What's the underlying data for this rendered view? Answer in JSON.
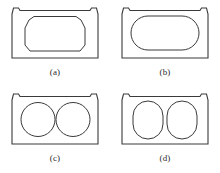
{
  "figure": {
    "type": "engineering-line-drawing",
    "stroke_color": "#3a3a3a",
    "fill_color": "#ffffff",
    "background_color": "#ffffff",
    "panels": [
      {
        "label": "(a)",
        "outer_shape": "trapezoidal box with notched top corners",
        "inner_void": "single octagonal cell",
        "void_count": 1
      },
      {
        "label": "(b)",
        "outer_shape": "trapezoidal box with notched top corners",
        "inner_void": "single horizontal stadium cell",
        "void_count": 1
      },
      {
        "label": "(c)",
        "outer_shape": "trapezoidal box with notched top corners",
        "inner_void": "two circular cells",
        "void_count": 2
      },
      {
        "label": "(d)",
        "outer_shape": "trapezoidal box with notched top corners",
        "inner_void": "two vertical stadium cells",
        "void_count": 2
      }
    ]
  }
}
